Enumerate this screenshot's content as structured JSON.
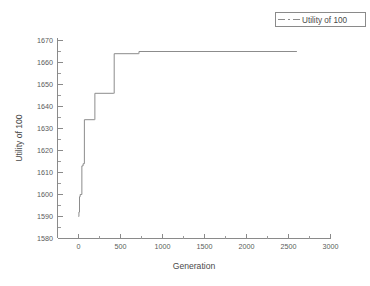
{
  "chart_data": {
    "type": "line",
    "title": "",
    "xlabel": "Generation",
    "ylabel": "Utility of 100",
    "xlim": [
      -250,
      3000
    ],
    "ylim": [
      1580,
      1675
    ],
    "xticks": [
      0,
      500,
      1000,
      1500,
      2000,
      2500,
      3000
    ],
    "yticks": [
      1580,
      1590,
      1600,
      1610,
      1620,
      1630,
      1640,
      1650,
      1660,
      1670
    ],
    "xtick_labels": [
      "0",
      "500",
      "1000",
      "1500",
      "2000",
      "2500",
      "3000"
    ],
    "ytick_labels": [
      "1580",
      "1590",
      "1600",
      "1610",
      "1620",
      "1630",
      "1640",
      "1650",
      "1660",
      "1670"
    ],
    "grid": false,
    "legend_position": "top-right",
    "minor_ticks": true,
    "series": [
      {
        "name": "Utility of 100",
        "color": "#8c8c8c",
        "style": "step",
        "x": [
          0,
          5,
          12,
          20,
          40,
          55,
          70,
          190,
          195,
          420,
          425,
          715,
          720,
          2600
        ],
        "values": [
          1590,
          1592,
          1599,
          1600,
          1613,
          1614,
          1634,
          1634,
          1646,
          1646,
          1664,
          1664,
          1665,
          1665
        ]
      }
    ],
    "legend": [
      {
        "label": "Utility of 100",
        "marker": "dash-dot-line",
        "color": "#8c8c8c"
      }
    ]
  },
  "axes": {
    "x_axis_name": "Generation",
    "y_axis_name": "Utility of 100"
  }
}
